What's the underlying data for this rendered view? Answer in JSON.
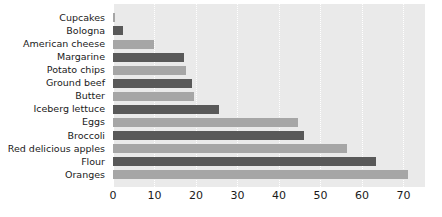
{
  "chart_data": {
    "type": "bar",
    "orientation": "horizontal",
    "title": "",
    "subtitle": "",
    "xlabel": "",
    "ylabel": "",
    "xlim": [
      0,
      75.2
    ],
    "ylim": [
      0,
      14
    ],
    "grid": true,
    "grid_axis": "x",
    "legend": false,
    "legend_position": "none",
    "background": "#eaeaea",
    "xticks": [
      0,
      10,
      20,
      30,
      40,
      50,
      60,
      70
    ],
    "xticklabels": [
      "0",
      "10",
      "20",
      "30",
      "40",
      "50",
      "60",
      "70"
    ],
    "categories": [
      "Cupcakes",
      "Bologna",
      "American cheese",
      "Margarine",
      "Potato chips",
      "Ground beef",
      "Butter",
      "Iceberg lettuce",
      "Eggs",
      "Broccoli",
      "Red delicious apples",
      "Flour",
      "Oranges"
    ],
    "values": [
      0.4,
      2.5,
      10,
      17,
      17.5,
      19,
      19.5,
      25.5,
      44.5,
      46,
      56.5,
      63.5,
      71
    ],
    "bar_colors": [
      "#a6a6a6",
      "#595959",
      "#a6a6a6",
      "#595959",
      "#a6a6a6",
      "#595959",
      "#a6a6a6",
      "#595959",
      "#a6a6a6",
      "#595959",
      "#a6a6a6",
      "#595959",
      "#a6a6a6"
    ],
    "colors": {
      "bar_dark": "#595959",
      "bar_light": "#a6a6a6",
      "plot_background": "#eaeaea",
      "gridline": "#ffffff",
      "text": "#1a1a1a",
      "page_background": "#ffffff"
    }
  }
}
